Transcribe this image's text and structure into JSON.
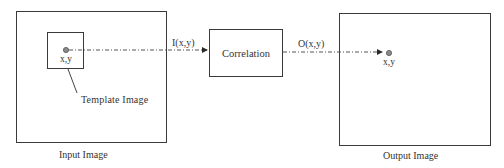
{
  "diagram": {
    "input_box": {
      "caption": "Input Image",
      "template_box": {
        "caption": "Template Image",
        "point_label": "x,y"
      }
    },
    "signal_in_label": "I(x,y)",
    "process_box": {
      "label": "Correlation"
    },
    "signal_out_label": "O(x,y)",
    "output_box": {
      "caption": "Output Image",
      "point_label": "x,y"
    },
    "colors": {
      "stroke": "#3a3a3a",
      "point_fill": "#8a8a8a",
      "text": "#333333"
    }
  }
}
